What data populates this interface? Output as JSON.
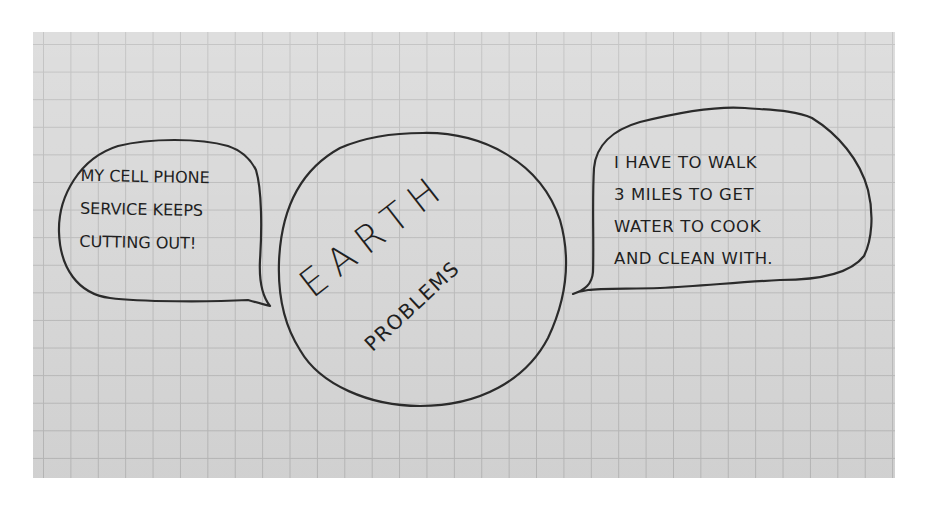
{
  "scene": {
    "description": "Hand-drawn sketch on grid paper",
    "paper_color": "#d7d7d7",
    "grid_color": "#b9b9b9",
    "ink_color": "#2b2b2b"
  },
  "center_circle": {
    "title_line1": "EARTH",
    "title_line2": "PROBLEMS"
  },
  "left_bubble": {
    "lines": [
      "MY CELL PHONE",
      "SERVICE KEEPS",
      "CUTTING OUT!"
    ]
  },
  "right_bubble": {
    "lines": [
      "I HAVE TO WALK",
      "3 MILES TO GET",
      "WATER TO COOK",
      "AND CLEAN WITH."
    ]
  }
}
